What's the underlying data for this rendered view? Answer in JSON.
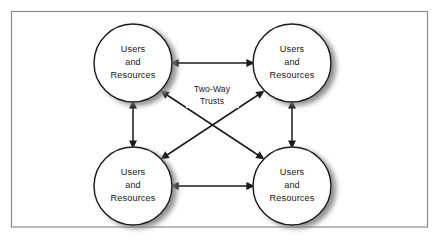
{
  "figure": {
    "frame": {
      "border_color": "#8c8c8c",
      "background_color": "#ffffff"
    },
    "style": {
      "node_fill": "#ffffff",
      "node_stroke": "#1a1a1a",
      "shadow_color": "#9a9a9a",
      "connector_color": "#1a1a1a",
      "text_color": "#1a1a1a"
    }
  },
  "nodes": [
    {
      "id": "node-top-left",
      "name": "users-and-resources-top-left",
      "line1": "Users",
      "line2": "and",
      "line3": "Resources",
      "cx": 133,
      "cy": 63,
      "r": 39
    },
    {
      "id": "node-top-right",
      "name": "users-and-resources-top-right",
      "line1": "Users",
      "line2": "and",
      "line3": "Resources",
      "cx": 292,
      "cy": 63,
      "r": 39
    },
    {
      "id": "node-bottom-left",
      "name": "users-and-resources-bottom-left",
      "line1": "Users",
      "line2": "and",
      "line3": "Resources",
      "cx": 133,
      "cy": 186,
      "r": 39
    },
    {
      "id": "node-bottom-right",
      "name": "users-and-resources-bottom-right",
      "line1": "Users",
      "line2": "and",
      "line3": "Resources",
      "cx": 292,
      "cy": 186,
      "r": 39
    }
  ],
  "edges": [
    {
      "id": "edge-top",
      "name": "connector-top-horizontal",
      "from": "node-top-left",
      "to": "node-top-right",
      "arrowheads": "both",
      "orientation": "horizontal"
    },
    {
      "id": "edge-bottom",
      "name": "connector-bottom-horizontal",
      "from": "node-bottom-left",
      "to": "node-bottom-right",
      "arrowheads": "both",
      "orientation": "horizontal"
    },
    {
      "id": "edge-left",
      "name": "connector-left-vertical",
      "from": "node-top-left",
      "to": "node-bottom-left",
      "arrowheads": "both",
      "orientation": "vertical"
    },
    {
      "id": "edge-right",
      "name": "connector-right-vertical",
      "from": "node-top-right",
      "to": "node-bottom-right",
      "arrowheads": "both",
      "orientation": "vertical"
    },
    {
      "id": "edge-diagonal-a",
      "name": "connector-diagonal-topleft-bottomright",
      "from": "node-top-left",
      "to": "node-bottom-right",
      "arrowheads": "both",
      "orientation": "diagonal"
    },
    {
      "id": "edge-diagonal-b",
      "name": "connector-diagonal-bottomleft-topright",
      "from": "node-bottom-left",
      "to": "node-top-right",
      "arrowheads": "both",
      "orientation": "diagonal"
    }
  ],
  "labels": {
    "trust_label": {
      "line1": "Two-Way",
      "line2": "Trusts",
      "x": 212,
      "y": 92
    }
  }
}
